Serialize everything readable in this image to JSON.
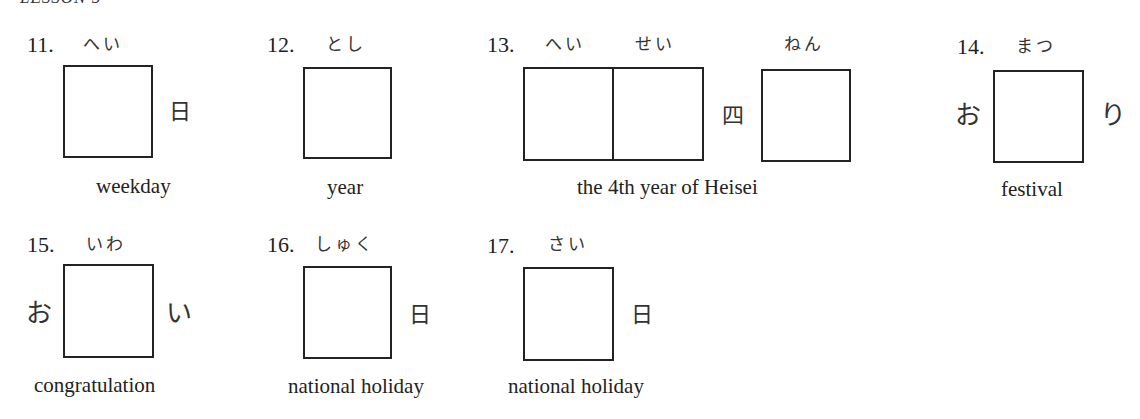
{
  "header": {
    "lesson": "LESSON 5"
  },
  "items": [
    {
      "number": "11.",
      "furigana": [
        "へい"
      ],
      "prefix": "",
      "suffix": "日",
      "meaning": "weekday"
    },
    {
      "number": "12.",
      "furigana": [
        "とし"
      ],
      "prefix": "",
      "suffix": "",
      "meaning": "year"
    },
    {
      "number": "13.",
      "furigana": [
        "へい",
        "せい",
        "ねん"
      ],
      "between": "四",
      "meaning": "the 4th year of Heisei"
    },
    {
      "number": "14.",
      "furigana": [
        "まつ"
      ],
      "prefix": "お",
      "suffix": "り",
      "meaning": "festival"
    },
    {
      "number": "15.",
      "furigana": [
        "いわ"
      ],
      "prefix": "お",
      "suffix": "い",
      "meaning": "congratulation"
    },
    {
      "number": "16.",
      "furigana": [
        "しゅく"
      ],
      "prefix": "",
      "suffix": "日",
      "meaning": "national holiday"
    },
    {
      "number": "17.",
      "furigana": [
        "さい"
      ],
      "prefix": "",
      "suffix": "日",
      "meaning": "national holiday"
    }
  ]
}
